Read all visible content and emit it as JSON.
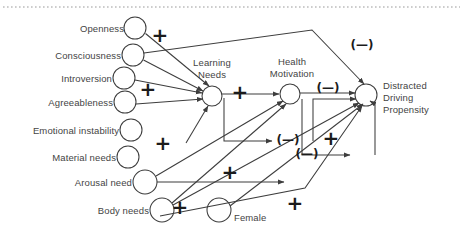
{
  "figure": {
    "top_rule": "dotted",
    "stroke_color": "#3d3d3d",
    "text_color": "#444444",
    "sign_color": "#1b1b1b"
  },
  "nodes": [
    {
      "id": "openness",
      "label": "Openness",
      "label_side": "right",
      "cx": 135,
      "cy": 28,
      "r": 11
    },
    {
      "id": "consciousness",
      "label": "Consciousness",
      "label_side": "right",
      "cx": 133,
      "cy": 55,
      "r": 11
    },
    {
      "id": "introversion",
      "label": "Introversion",
      "label_side": "right",
      "cx": 124,
      "cy": 78,
      "r": 11
    },
    {
      "id": "agreeableness",
      "label": "Agreeableness",
      "label_side": "right",
      "cx": 125,
      "cy": 102,
      "r": 11
    },
    {
      "id": "emotional",
      "label": "Emotional instability",
      "label_side": "right",
      "cx": 131,
      "cy": 130,
      "r": 11
    },
    {
      "id": "material",
      "label": "Material needs",
      "label_side": "right",
      "cx": 128,
      "cy": 157,
      "r": 11
    },
    {
      "id": "arousal",
      "label": "Arousal need",
      "label_side": "right",
      "cx": 145,
      "cy": 182,
      "r": 12
    },
    {
      "id": "body",
      "label": "Body needs",
      "label_side": "right",
      "cx": 162,
      "cy": 210,
      "r": 12
    },
    {
      "id": "female",
      "label": "Female",
      "label_side": "below-right",
      "cx": 219,
      "cy": 210,
      "r": 12
    },
    {
      "id": "learning",
      "label": "Learning\nNeeds",
      "label_side": "above",
      "cx": 212,
      "cy": 96,
      "r": 10
    },
    {
      "id": "health",
      "label": "Health\nMotivation",
      "label_side": "above",
      "cx": 290,
      "cy": 94,
      "r": 10
    },
    {
      "id": "ddp",
      "label": "Distracted\nDriving\nPropensity",
      "label_side": "right",
      "cx": 366,
      "cy": 95,
      "r": 11
    }
  ],
  "node_labels": [
    {
      "id": "openness",
      "text": "Openness",
      "x": 124,
      "y": 28
    },
    {
      "id": "consciousness",
      "text": "Consciousness",
      "x": 121,
      "y": 55
    },
    {
      "id": "introversion",
      "text": "Introversion",
      "x": 112,
      "y": 78
    },
    {
      "id": "agreeableness",
      "text": "Agreeableness",
      "x": 113,
      "y": 102
    },
    {
      "id": "emotional",
      "text": "Emotional instability",
      "x": 119,
      "y": 130
    },
    {
      "id": "material",
      "text": "Material needs",
      "x": 116,
      "y": 157
    },
    {
      "id": "arousal",
      "text": "Arousal need",
      "x": 132,
      "y": 182
    },
    {
      "id": "body",
      "text": "Body needs",
      "x": 149,
      "y": 210
    },
    {
      "id": "female",
      "text": "Female",
      "x": 234,
      "y": 217
    },
    {
      "id": "learning_1",
      "text": "Learning",
      "x": 212,
      "y": 62
    },
    {
      "id": "learning_2",
      "text": "Needs",
      "x": 212,
      "y": 74
    },
    {
      "id": "health_1",
      "text": "Health",
      "x": 292,
      "y": 61
    },
    {
      "id": "health_2",
      "text": "Motivation",
      "x": 292,
      "y": 73
    },
    {
      "id": "ddp_1",
      "text": "Distracted",
      "x": 383,
      "y": 85
    },
    {
      "id": "ddp_2",
      "text": "Driving",
      "x": 383,
      "y": 97
    },
    {
      "id": "ddp_3",
      "text": "Propensity",
      "x": 383,
      "y": 109
    }
  ],
  "signs": [
    {
      "id": "plus-openness-learning",
      "symbol": "+",
      "x": 160,
      "y": 35
    },
    {
      "id": "plus-introversion-learning",
      "symbol": "+",
      "x": 148,
      "y": 89
    },
    {
      "id": "plus-learning-health",
      "symbol": "+",
      "x": 240,
      "y": 92
    },
    {
      "id": "plus-material-learning",
      "symbol": "+",
      "x": 163,
      "y": 143
    },
    {
      "id": "plus-body-learning",
      "symbol": "+",
      "x": 180,
      "y": 207
    },
    {
      "id": "plus-arousal-ddp",
      "symbol": "+",
      "x": 230,
      "y": 172
    },
    {
      "id": "plus-female-ddp",
      "symbol": "+",
      "x": 295,
      "y": 203
    },
    {
      "id": "plus-lower-ddp",
      "symbol": "+",
      "x": 331,
      "y": 138
    },
    {
      "id": "minus-consciousness-ddp",
      "symbol": "(—)",
      "x": 362,
      "y": 45
    },
    {
      "id": "minus-health-ddp",
      "symbol": "(—)",
      "x": 328,
      "y": 88
    },
    {
      "id": "minus-learning-feedback",
      "symbol": "(—)",
      "x": 288,
      "y": 140
    },
    {
      "id": "minus-ddp-feedback",
      "symbol": "(—)",
      "x": 307,
      "y": 154
    }
  ],
  "edges": [
    {
      "id": "openness-to-learning",
      "from": "openness",
      "to": "learning",
      "sign": "+"
    },
    {
      "id": "consciousness-to-learning",
      "from": "consciousness",
      "to": "learning",
      "sign": "+"
    },
    {
      "id": "consciousness-to-ddp",
      "from": "consciousness",
      "to": "ddp",
      "sign": "(—)"
    },
    {
      "id": "introversion-to-learning",
      "from": "introversion",
      "to": "learning",
      "sign": "+"
    },
    {
      "id": "agreeableness-to-learning",
      "from": "agreeableness",
      "to": "learning",
      "sign": "+"
    },
    {
      "id": "material-to-learning",
      "from": "material",
      "to": "learning",
      "sign": "+"
    },
    {
      "id": "arousal-to-health",
      "from": "arousal",
      "to": "health",
      "sign": "+"
    },
    {
      "id": "arousal-to-ddp",
      "from": "arousal",
      "to": "ddp",
      "sign": "+"
    },
    {
      "id": "body-to-health",
      "from": "body",
      "to": "health",
      "sign": "+"
    },
    {
      "id": "body-to-ddp",
      "from": "body",
      "to": "ddp",
      "sign": "+"
    },
    {
      "id": "female-to-ddp",
      "from": "female",
      "to": "ddp",
      "sign": "+"
    },
    {
      "id": "learning-to-health",
      "from": "learning",
      "to": "health",
      "sign": "+"
    },
    {
      "id": "learning-to-health-feedback",
      "from": "learning",
      "to": "health",
      "sign": "(—)"
    },
    {
      "id": "health-to-ddp",
      "from": "health",
      "to": "ddp",
      "sign": "(—)"
    },
    {
      "id": "health-to-ddp-feedback",
      "from": "health",
      "to": "ddp",
      "sign": "(—)"
    }
  ]
}
